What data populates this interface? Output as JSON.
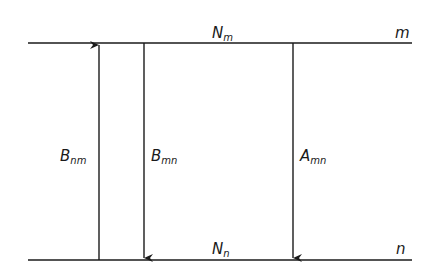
{
  "diagram": {
    "levels": [
      {
        "id": "upper",
        "name": "m",
        "population_label": {
          "main": "N",
          "sub": "m"
        }
      },
      {
        "id": "lower",
        "name": "n",
        "population_label": {
          "main": "N",
          "sub": "n"
        }
      }
    ],
    "transitions": [
      {
        "id": "absorption",
        "label": {
          "main": "B",
          "sub": "nm"
        },
        "direction": "up"
      },
      {
        "id": "stimulated-emission",
        "label": {
          "main": "B",
          "sub": "mn"
        },
        "direction": "down"
      },
      {
        "id": "spontaneous-emission",
        "label": {
          "main": "A",
          "sub": "mn"
        },
        "direction": "down"
      }
    ],
    "colors": {
      "line": "#1a1a1a",
      "background": "#ffffff"
    }
  }
}
